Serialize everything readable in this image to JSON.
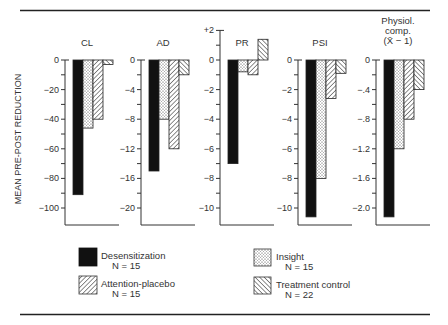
{
  "chart_data": {
    "type": "bar",
    "ylabel": "MEAN PRE-POST REDUCTION",
    "series": [
      {
        "name": "Desensitization",
        "n_label": "N = 15",
        "pattern": "solid"
      },
      {
        "name": "Insight",
        "n_label": "N = 15",
        "pattern": "dots"
      },
      {
        "name": "Attention-placebo",
        "n_label": "N = 15",
        "pattern": "diag-right"
      },
      {
        "name": "Treatment control",
        "n_label": "N = 22",
        "pattern": "diag-left"
      }
    ],
    "panels": [
      {
        "title": [
          "CL"
        ],
        "ylim": [
          -100,
          0
        ],
        "ticks": [
          0,
          -10,
          -20,
          -30,
          -40,
          -50,
          -60,
          -70,
          -80,
          -90,
          -100
        ],
        "tick_labels": [
          {
            "v": 0,
            "t": "0"
          },
          {
            "v": -20,
            "t": "−20"
          },
          {
            "v": -40,
            "t": "−40"
          },
          {
            "v": -60,
            "t": "−60"
          },
          {
            "v": -80,
            "t": "−80"
          },
          {
            "v": -100,
            "t": "−100"
          }
        ],
        "values": [
          -91,
          -46,
          -40,
          -3
        ]
      },
      {
        "title": [
          "AD"
        ],
        "ylim": [
          -20,
          0
        ],
        "ticks": [
          0,
          -2,
          -4,
          -6,
          -8,
          -10,
          -12,
          -14,
          -16,
          -18,
          -20
        ],
        "tick_labels": [
          {
            "v": 0,
            "t": "0"
          },
          {
            "v": -4,
            "t": "−4"
          },
          {
            "v": -8,
            "t": "−8"
          },
          {
            "v": -12,
            "t": "−12"
          },
          {
            "v": -16,
            "t": "−16"
          },
          {
            "v": -20,
            "t": "−20"
          }
        ],
        "values": [
          -15,
          -8,
          -12,
          -2
        ]
      },
      {
        "title": [
          "PR"
        ],
        "ylim": [
          -10,
          2
        ],
        "ticks": [
          2,
          1,
          0,
          -1,
          -2,
          -3,
          -4,
          -5,
          -6,
          -7,
          -8,
          -9,
          -10
        ],
        "tick_labels": [
          {
            "v": 2,
            "t": "+2"
          },
          {
            "v": 0,
            "t": "0"
          },
          {
            "v": -2,
            "t": "−2"
          },
          {
            "v": -4,
            "t": "−4"
          },
          {
            "v": -6,
            "t": "−6"
          },
          {
            "v": -8,
            "t": "−8"
          },
          {
            "v": -10,
            "t": "−10"
          }
        ],
        "values": [
          -7,
          -0.8,
          -1,
          1.4
        ]
      },
      {
        "title": [
          "PSI"
        ],
        "ylim": [
          -10,
          0
        ],
        "ticks": [
          0,
          -1,
          -2,
          -3,
          -4,
          -5,
          -6,
          -7,
          -8,
          -9,
          -10
        ],
        "tick_labels": [
          {
            "v": 0,
            "t": "0"
          },
          {
            "v": -2,
            "t": "−2"
          },
          {
            "v": -4,
            "t": "−4"
          },
          {
            "v": -6,
            "t": "−6"
          },
          {
            "v": -8,
            "t": "−8"
          },
          {
            "v": -10,
            "t": "−10"
          }
        ],
        "values": [
          -10.6,
          -8,
          -2.6,
          -0.9
        ]
      },
      {
        "title": [
          "Physiol.",
          "comp.",
          "(X̄ − 1)"
        ],
        "ylim": [
          -2.0,
          0
        ],
        "ticks": [
          0,
          -0.2,
          -0.4,
          -0.6,
          -0.8,
          -1.0,
          -1.2,
          -1.4,
          -1.6,
          -1.8,
          -2.0
        ],
        "tick_labels": [
          {
            "v": 0,
            "t": "0"
          },
          {
            "v": -0.4,
            "t": "−.4"
          },
          {
            "v": -0.8,
            "t": "−.8"
          },
          {
            "v": -1.2,
            "t": "−1.2"
          },
          {
            "v": -1.6,
            "t": "−1.6"
          },
          {
            "v": -2.0,
            "t": "−2.0"
          }
        ],
        "values": [
          -2.12,
          -1.2,
          -0.8,
          -0.4
        ]
      }
    ]
  }
}
